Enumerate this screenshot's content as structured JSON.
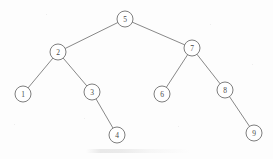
{
  "figure": {
    "kind": "binary-search-tree-diagram",
    "width": 273,
    "height": 159,
    "background_color": "#fdfdfd",
    "node_stroke_color": "#6f6f6f",
    "edge_stroke_color": "#7b7b7b",
    "label_color": "#4a4a4a",
    "node_radius": 8
  },
  "chart_data": {
    "type": "diagram",
    "title": "",
    "xlabel": "",
    "ylabel": "",
    "root": "5",
    "nodes": [
      {
        "id": "n5",
        "label": "5",
        "x": 125,
        "y": 19,
        "r": 8,
        "depth": 0,
        "side": "root"
      },
      {
        "id": "n2",
        "label": "2",
        "x": 58,
        "y": 52,
        "r": 8,
        "depth": 1,
        "side": "left"
      },
      {
        "id": "n7",
        "label": "7",
        "x": 192,
        "y": 48,
        "r": 8,
        "depth": 1,
        "side": "right"
      },
      {
        "id": "n1",
        "label": "1",
        "x": 23,
        "y": 94,
        "r": 8,
        "depth": 2,
        "side": "left"
      },
      {
        "id": "n3",
        "label": "3",
        "x": 92,
        "y": 92,
        "r": 8,
        "depth": 2,
        "side": "right"
      },
      {
        "id": "n6",
        "label": "6",
        "x": 162,
        "y": 94,
        "r": 8,
        "depth": 2,
        "side": "left"
      },
      {
        "id": "n8",
        "label": "8",
        "x": 225,
        "y": 90,
        "r": 8,
        "depth": 2,
        "side": "right"
      },
      {
        "id": "n4",
        "label": "4",
        "x": 117,
        "y": 135,
        "r": 8,
        "depth": 3,
        "side": "right"
      },
      {
        "id": "n9",
        "label": "9",
        "x": 254,
        "y": 133,
        "r": 8,
        "depth": 3,
        "side": "right"
      }
    ],
    "edges": [
      {
        "from": "n5",
        "to": "n2",
        "relation": "left-child"
      },
      {
        "from": "n5",
        "to": "n7",
        "relation": "right-child"
      },
      {
        "from": "n2",
        "to": "n1",
        "relation": "left-child"
      },
      {
        "from": "n2",
        "to": "n3",
        "relation": "right-child"
      },
      {
        "from": "n3",
        "to": "n4",
        "relation": "right-child"
      },
      {
        "from": "n7",
        "to": "n6",
        "relation": "left-child"
      },
      {
        "from": "n7",
        "to": "n8",
        "relation": "right-child"
      },
      {
        "from": "n8",
        "to": "n9",
        "relation": "right-child"
      }
    ],
    "inorder_sequence": [
      "1",
      "2",
      "3",
      "4",
      "5",
      "6",
      "7",
      "8",
      "9"
    ]
  },
  "artifacts": {
    "specks": [
      {
        "x": 46,
        "y": 14,
        "size": 1.2
      },
      {
        "x": 210,
        "y": 24,
        "size": 1.0
      },
      {
        "x": 84,
        "y": 118,
        "size": 1.1
      },
      {
        "x": 178,
        "y": 126,
        "size": 1.0
      },
      {
        "x": 252,
        "y": 64,
        "size": 1.2
      },
      {
        "x": 14,
        "y": 124,
        "size": 1.0
      }
    ]
  }
}
